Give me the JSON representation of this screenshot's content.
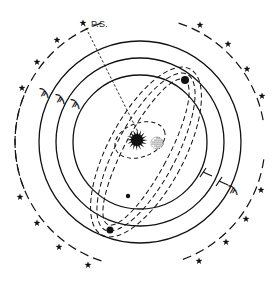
{
  "diagram": {
    "label_ps": "P.S.",
    "colors": {
      "ink": "#111111",
      "background": "#ffffff"
    },
    "center": {
      "x": 140,
      "y": 142
    },
    "orbits": [
      {
        "name": "inner-orbit",
        "r": 67
      },
      {
        "name": "middle-orbit",
        "r": 84
      },
      {
        "name": "outer-orbit",
        "r": 101
      }
    ],
    "star_ring_radius": 125,
    "stars": [
      {
        "x": 22,
        "y": 88
      },
      {
        "x": 37,
        "y": 62
      },
      {
        "x": 57,
        "y": 40
      },
      {
        "x": 83,
        "y": 23
      },
      {
        "x": 200,
        "y": 25
      },
      {
        "x": 228,
        "y": 44
      },
      {
        "x": 247,
        "y": 69
      },
      {
        "x": 262,
        "y": 96
      },
      {
        "x": 20,
        "y": 197
      },
      {
        "x": 37,
        "y": 223
      },
      {
        "x": 59,
        "y": 247
      },
      {
        "x": 88,
        "y": 265
      },
      {
        "x": 261,
        "y": 190
      },
      {
        "x": 246,
        "y": 219
      },
      {
        "x": 226,
        "y": 242
      },
      {
        "x": 199,
        "y": 261
      }
    ],
    "planets": [
      {
        "name": "planet-upper-right",
        "x": 185,
        "y": 80,
        "r": 4
      },
      {
        "name": "planet-small-lower",
        "x": 128,
        "y": 196,
        "r": 2.2
      },
      {
        "name": "planet-lower-left",
        "x": 110,
        "y": 230,
        "r": 3.5
      }
    ],
    "left_symbols": [
      "ϡ",
      "ϡ",
      "ϡ"
    ],
    "right_symbol": "ϡ",
    "sun_icon": "spiky-sun",
    "moon_icon": "dotted-disc"
  }
}
